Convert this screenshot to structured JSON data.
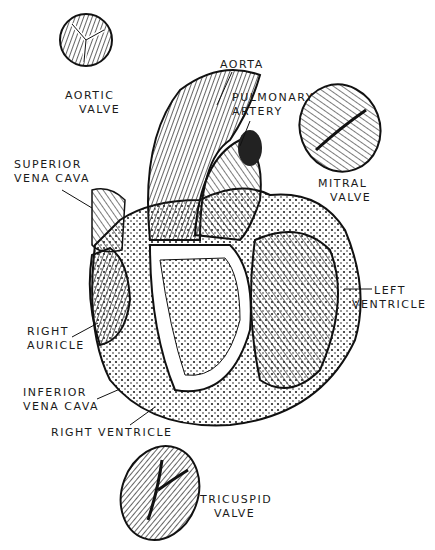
{
  "labels": {
    "aortic_valve": [
      "AORTIC",
      "VALVE"
    ],
    "aorta": "AORTA",
    "pulmonary_artery": [
      "PULMONARY",
      "ARTERY"
    ],
    "mitral_valve": [
      "MITRAL",
      "VALVE"
    ],
    "superior_vena_cava": [
      "SUPERIOR",
      "VENA CAVA"
    ],
    "left_ventricle": [
      "LEFT",
      "VENTRICLE"
    ],
    "right_auricle": [
      "RIGHT",
      "AURICLE"
    ],
    "inferior_vena_cava": [
      "INFERIOR",
      "VENA CAVA"
    ],
    "right_ventricle": "RIGHT VENTRICLE",
    "tricuspid_valve": [
      "TRICUSPID",
      "VALVE"
    ]
  },
  "colors": {
    "ink": "#1a1a1a",
    "paper": "#ffffff"
  }
}
